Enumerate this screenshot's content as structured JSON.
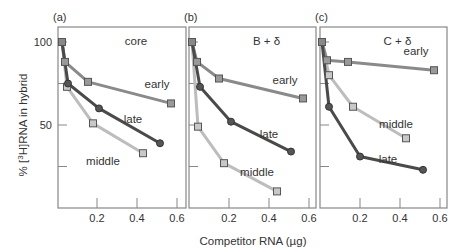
{
  "figure": {
    "ylabel_prefix": "% [",
    "ylabel_sup": "3",
    "ylabel_suffix": "H]RNA in hybrid",
    "xlabel": "Competitor RNA (µg)",
    "yticks": [
      100,
      75,
      50,
      25
    ],
    "ytick_labels": [
      "100",
      "",
      "50",
      ""
    ],
    "xticks": [
      0.2,
      0.4,
      0.6
    ],
    "xtick_labels": [
      "0.2",
      "0.4",
      "0.6"
    ],
    "colors": {
      "early": "#8a8a8a",
      "late": "#4a4a4a",
      "middle": "#bdbdbd",
      "axis": "#888888"
    }
  },
  "chart_data": [
    {
      "type": "line",
      "panel": "(a)",
      "title": "core",
      "xlabel": "Competitor RNA (µg)",
      "ylabel": "% [3H]RNA in hybrid",
      "xlim": [
        0,
        0.64
      ],
      "ylim": [
        0,
        100
      ],
      "series": [
        {
          "name": "early",
          "marker": "square",
          "x": [
            0.025,
            0.04,
            0.155,
            0.57
          ],
          "y": [
            100,
            88,
            76,
            63
          ],
          "label_pos": [
            0.5,
            72
          ]
        },
        {
          "name": "late",
          "marker": "circle",
          "x": [
            0.025,
            0.055,
            0.21,
            0.515
          ],
          "y": [
            100,
            75,
            60,
            39
          ],
          "label_pos": [
            0.38,
            51
          ]
        },
        {
          "name": "middle",
          "marker": "square",
          "x": [
            0.025,
            0.05,
            0.18,
            0.43
          ],
          "y": [
            100,
            73,
            51,
            33
          ],
          "label_pos": [
            0.23,
            26
          ]
        }
      ]
    },
    {
      "type": "line",
      "panel": "(b)",
      "title": "B + δ",
      "xlabel": "Competitor RNA (µg)",
      "ylabel": "% [3H]RNA in hybrid",
      "xlim": [
        0,
        0.64
      ],
      "ylim": [
        0,
        100
      ],
      "series": [
        {
          "name": "early",
          "marker": "square",
          "x": [
            0.015,
            0.04,
            0.15,
            0.57
          ],
          "y": [
            100,
            88,
            78,
            66
          ],
          "label_pos": [
            0.48,
            75
          ]
        },
        {
          "name": "late",
          "marker": "circle",
          "x": [
            0.015,
            0.055,
            0.21,
            0.51
          ],
          "y": [
            100,
            73,
            52,
            34
          ],
          "label_pos": [
            0.4,
            42
          ]
        },
        {
          "name": "middle",
          "marker": "square",
          "x": [
            0.015,
            0.045,
            0.175,
            0.44
          ],
          "y": [
            100,
            49,
            27,
            10
          ],
          "label_pos": [
            0.34,
            19
          ]
        }
      ]
    },
    {
      "type": "line",
      "panel": "(c)",
      "title": "C + δ",
      "xlabel": "Competitor RNA (µg)",
      "ylabel": "% [3H]RNA in hybrid",
      "xlim": [
        0,
        0.64
      ],
      "ylim": [
        0,
        100
      ],
      "series": [
        {
          "name": "early",
          "marker": "square",
          "x": [
            0.01,
            0.035,
            0.14,
            0.57
          ],
          "y": [
            100,
            89,
            88,
            83
          ],
          "label_pos": [
            0.48,
            92
          ]
        },
        {
          "name": "middle",
          "marker": "square",
          "x": [
            0.01,
            0.045,
            0.165,
            0.43
          ],
          "y": [
            100,
            80,
            61,
            42
          ],
          "label_pos": [
            0.38,
            48
          ]
        },
        {
          "name": "late",
          "marker": "circle",
          "x": [
            0.01,
            0.045,
            0.2,
            0.515
          ],
          "y": [
            100,
            61,
            31,
            23
          ],
          "label_pos": [
            0.34,
            27
          ]
        }
      ]
    }
  ]
}
